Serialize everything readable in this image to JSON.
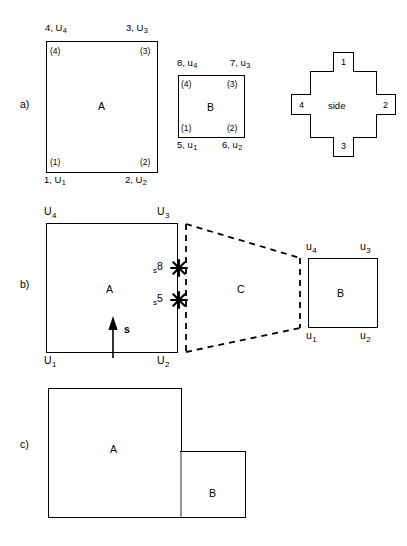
{
  "figure": {
    "panels": [
      "a)",
      "b)",
      "c)"
    ],
    "line_color": "#000000",
    "background": "#ffffff"
  },
  "panel_a": {
    "letter": "a)",
    "element_a": {
      "name": "A",
      "global_labels": {
        "n1": "1, U",
        "n1_sub": "1",
        "n2": "2, U",
        "n2_sub": "2",
        "n3": "3, U",
        "n3_sub": "3",
        "n4": "4, U",
        "n4_sub": "4"
      },
      "local_labels": {
        "c1": "(1)",
        "c2": "(2)",
        "c3": "(3)",
        "c4": "(4)"
      }
    },
    "element_b": {
      "name": "B",
      "global_labels": {
        "n5": "5, u",
        "n5_sub": "1",
        "n6": "6, u",
        "n6_sub": "2",
        "n7": "7, u",
        "n7_sub": "3",
        "n8": "8, u",
        "n8_sub": "4"
      },
      "local_labels": {
        "c1": "(1)",
        "c2": "(2)",
        "c3": "(3)",
        "c4": "(4)"
      }
    },
    "side_key": {
      "center_label": "side",
      "tabs": {
        "top": "1",
        "right": "2",
        "bottom": "3",
        "left": "4"
      }
    }
  },
  "panel_b": {
    "letter": "b)",
    "element_a": {
      "name": "A",
      "corner_labels": {
        "bl": "U",
        "bl_sub": "1",
        "br": "U",
        "br_sub": "2",
        "tr": "U",
        "tr_sub": "3",
        "tl": "U",
        "tl_sub": "4"
      },
      "arrow_label": "s"
    },
    "interface": {
      "name": "C",
      "style": "dashed",
      "markers": [
        {
          "label": "s",
          "sub": "8"
        },
        {
          "label": "s",
          "sub": "5"
        }
      ]
    },
    "element_b": {
      "name": "B",
      "corner_labels": {
        "bl": "u",
        "bl_sub": "1",
        "br": "u",
        "br_sub": "2",
        "tr": "u",
        "tr_sub": "3",
        "tl": "u",
        "tl_sub": "4"
      }
    }
  },
  "panel_c": {
    "letter": "c)",
    "element_a": {
      "name": "A"
    },
    "element_b": {
      "name": "B"
    }
  }
}
